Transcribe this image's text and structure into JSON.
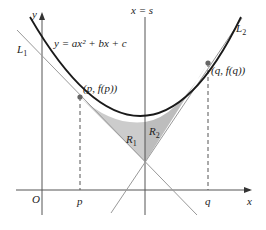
{
  "diagram": {
    "curve_label": "y = ax² + bx + c",
    "axis_x_label": "x",
    "axis_y_label": "y",
    "origin_label": "O",
    "vertical_line_label": "x = s",
    "tangent_left_label": "L",
    "tangent_left_sub": "1",
    "tangent_right_label": "L",
    "tangent_right_sub": "2",
    "point_p_label": "(p, f(p))",
    "point_q_label": "(q, f(q))",
    "tick_p": "p",
    "tick_q": "q",
    "region1_label": "R",
    "region1_sub": "1",
    "region2_label": "R",
    "region2_sub": "2",
    "colors": {
      "curve": "#1a1a1a",
      "tangent": "#999999",
      "axis": "#555555",
      "region_fill": "#cccccc",
      "point": "#666666"
    }
  }
}
